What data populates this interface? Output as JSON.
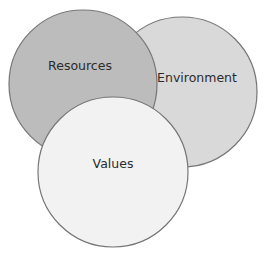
{
  "diagram": {
    "type": "venn",
    "circles": [
      {
        "id": "environment",
        "label": "Environment",
        "cx": 182,
        "cy": 92,
        "r": 75,
        "fill": "#d9d9d9",
        "stroke": "#767676",
        "label_x": 197,
        "label_y": 82
      },
      {
        "id": "resources",
        "label": "Resources",
        "cx": 83,
        "cy": 84,
        "r": 74,
        "fill": "#bcbcbc",
        "stroke": "#767676",
        "label_x": 80,
        "label_y": 70
      },
      {
        "id": "values",
        "label": "Values",
        "cx": 113,
        "cy": 172,
        "r": 75,
        "fill": "#f2f2f2",
        "stroke": "#767676",
        "label_x": 113,
        "label_y": 168
      }
    ]
  }
}
